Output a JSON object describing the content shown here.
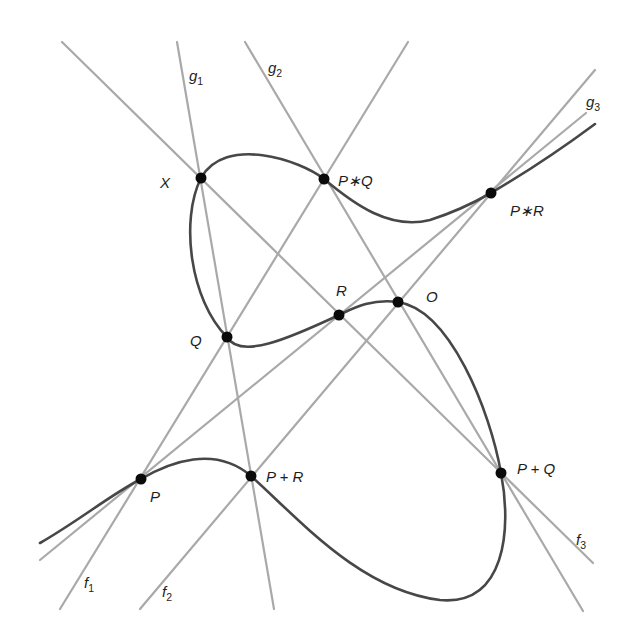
{
  "diagram": {
    "colors": {
      "curve": "#474747",
      "lines": "#a9a9a9",
      "points": "#0a0a0a",
      "labels": "#1e1e1e"
    },
    "points": [
      {
        "id": "X",
        "label": "X",
        "x": 201,
        "y": 178,
        "lx": 160,
        "ly": 188
      },
      {
        "id": "PsQ",
        "label": "P∗Q",
        "x": 324,
        "y": 179,
        "lx": 338,
        "ly": 186
      },
      {
        "id": "PsR",
        "label": "P∗R",
        "x": 491,
        "y": 193,
        "lx": 510,
        "ly": 216
      },
      {
        "id": "R",
        "label": "R",
        "x": 339,
        "y": 315,
        "lx": 336,
        "ly": 296
      },
      {
        "id": "O",
        "label": "O",
        "x": 398,
        "y": 302,
        "lx": 426,
        "ly": 302
      },
      {
        "id": "Q",
        "label": "Q",
        "x": 227,
        "y": 337,
        "lx": 190,
        "ly": 346
      },
      {
        "id": "P",
        "label": "P",
        "x": 141,
        "y": 479,
        "lx": 150,
        "ly": 502
      },
      {
        "id": "PpR",
        "label": "P + R",
        "x": 251,
        "y": 476,
        "lx": 266,
        "ly": 482
      },
      {
        "id": "PpQ",
        "label": "P + Q",
        "x": 501,
        "y": 473,
        "lx": 517,
        "ly": 474
      }
    ],
    "lines": [
      {
        "id": "f1",
        "name": "f",
        "sub": "1",
        "x1": 408,
        "y1": 42,
        "x2": 60,
        "y2": 609,
        "lx": 84,
        "ly": 588
      },
      {
        "id": "f2",
        "name": "f",
        "sub": "2",
        "x1": 595,
        "y1": 70,
        "x2": 140,
        "y2": 609,
        "lx": 162,
        "ly": 597
      },
      {
        "id": "f3",
        "name": "f",
        "sub": "3",
        "x1": 62,
        "y1": 42,
        "x2": 593,
        "y2": 563,
        "lx": 576,
        "ly": 545
      },
      {
        "id": "g1",
        "name": "g",
        "sub": "1",
        "x1": 177,
        "y1": 42,
        "x2": 274,
        "y2": 609,
        "lx": 189,
        "ly": 81
      },
      {
        "id": "g2",
        "name": "g",
        "sub": "2",
        "x1": 245,
        "y1": 42,
        "x2": 583,
        "y2": 611,
        "lx": 268,
        "ly": 73
      },
      {
        "id": "g3",
        "name": "g",
        "sub": "3",
        "x1": 586,
        "y1": 113,
        "x2": 40,
        "y2": 560,
        "lx": 586,
        "ly": 107
      }
    ],
    "curve_path": "M40,543 C80,520 110,495 141,479 C170,462 215,445 251,476 C300,520 360,590 440,600 C505,606 512,530 501,473 C490,410 450,310 398,302 C370,298 350,310 339,315 C290,338 240,360 227,337 C190,300 180,220 201,178 C225,135 300,160 324,179 C355,205 390,230 430,220 C455,212 470,205 491,193 C520,176 560,150 595,124"
  }
}
